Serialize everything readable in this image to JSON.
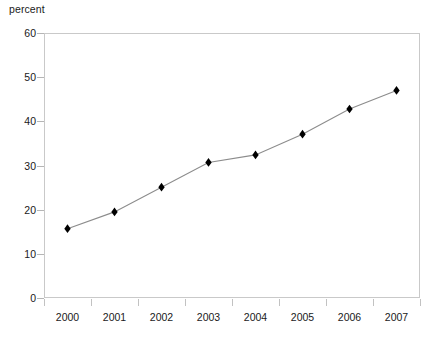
{
  "chart_data": {
    "type": "line",
    "title": "",
    "subtitle": "",
    "xlabel": "",
    "ylabel": "percent",
    "unit_label": "percent",
    "categories": [
      "2000",
      "2001",
      "2002",
      "2003",
      "2004",
      "2005",
      "2006",
      "2007"
    ],
    "x": [
      2000,
      2001,
      2002,
      2003,
      2004,
      2005,
      2006,
      2007
    ],
    "values": [
      15.7,
      19.5,
      25.1,
      30.7,
      32.4,
      37.1,
      42.8,
      47.0
    ],
    "series": [
      {
        "name": "percent",
        "values": [
          15.7,
          19.5,
          25.1,
          30.7,
          32.4,
          37.1,
          42.8,
          47.0
        ],
        "marker": "diamond",
        "marker_color": "#000000",
        "line_color": "#8c8c8c"
      }
    ],
    "ylim": [
      0,
      60
    ],
    "y_ticks": [
      0,
      10,
      20,
      30,
      40,
      50,
      60
    ],
    "y_tick_labels": [
      "0",
      "10",
      "20",
      "30",
      "40",
      "50",
      "60"
    ],
    "x_tick_labels": [
      "2000",
      "2001",
      "2002",
      "2003",
      "2004",
      "2005",
      "2006",
      "2007"
    ],
    "grid": false,
    "legend": false,
    "legend_position": "none",
    "frame_color": "#c9c9c9",
    "text_color": "#1a1a1a",
    "background": "#ffffff",
    "annotations": []
  }
}
